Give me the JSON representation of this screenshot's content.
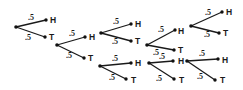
{
  "diagram": {
    "type": "probability-tree",
    "title": "",
    "edge_color": "#1a1a1a",
    "nodes": [
      {
        "id": "n0",
        "x": 16,
        "y": 27
      },
      {
        "id": "n1",
        "x": 57,
        "y": 45
      },
      {
        "id": "n2",
        "x": 101,
        "y": 33
      },
      {
        "id": "n3",
        "x": 100,
        "y": 66
      },
      {
        "id": "n4",
        "x": 147,
        "y": 45
      },
      {
        "id": "n5",
        "x": 149,
        "y": 63
      },
      {
        "id": "n6",
        "x": 191,
        "y": 26
      },
      {
        "id": "n7",
        "x": 187,
        "y": 61
      }
    ],
    "branches": [
      {
        "from": [
          16,
          27
        ],
        "to": [
          46,
          20
        ],
        "prob": ".5",
        "prob_pos": [
          28,
          20
        ],
        "outcome": "H",
        "outcome_pos": [
          50,
          23
        ]
      },
      {
        "from": [
          16,
          27
        ],
        "to": [
          45,
          37
        ],
        "prob": ".5",
        "prob_pos": [
          25,
          40
        ],
        "outcome": "T",
        "outcome_pos": [
          49,
          40
        ]
      },
      {
        "from": [
          57,
          45
        ],
        "to": [
          85,
          37
        ],
        "prob": ".5",
        "prob_pos": [
          69,
          36
        ],
        "outcome": "H",
        "outcome_pos": [
          89,
          40
        ]
      },
      {
        "from": [
          57,
          45
        ],
        "to": [
          84,
          58
        ],
        "prob": ".5",
        "prob_pos": [
          66,
          58
        ],
        "outcome": "T",
        "outcome_pos": [
          88,
          61
        ]
      },
      {
        "from": [
          101,
          33
        ],
        "to": [
          131,
          24
        ],
        "prob": ".5",
        "prob_pos": [
          113,
          24
        ],
        "outcome": "H",
        "outcome_pos": [
          135,
          27
        ]
      },
      {
        "from": [
          101,
          33
        ],
        "to": [
          131,
          41
        ],
        "prob": ".5",
        "prob_pos": [
          112,
          44
        ],
        "outcome": "T",
        "outcome_pos": [
          135,
          44
        ]
      },
      {
        "from": [
          100,
          66
        ],
        "to": [
          131,
          63
        ],
        "prob": ".5",
        "prob_pos": [
          112,
          61
        ],
        "outcome": "H",
        "outcome_pos": [
          135,
          66
        ]
      },
      {
        "from": [
          100,
          66
        ],
        "to": [
          126,
          79
        ],
        "prob": ".5",
        "prob_pos": [
          109,
          80
        ],
        "outcome": "T",
        "outcome_pos": [
          131,
          83
        ]
      },
      {
        "from": [
          147,
          45
        ],
        "to": [
          175,
          30
        ],
        "prob": ".5",
        "prob_pos": [
          158,
          32
        ],
        "outcome": "H",
        "outcome_pos": [
          178,
          34
        ]
      },
      {
        "from": [
          147,
          45
        ],
        "to": [
          174,
          50
        ],
        "prob": ".5",
        "prob_pos": [
          153,
          55
        ],
        "outcome": "T",
        "outcome_pos": [
          178,
          53
        ]
      },
      {
        "from": [
          149,
          63
        ],
        "to": [
          173,
          61
        ],
        "prob": ".5",
        "prob_pos": [
          159,
          59
        ],
        "outcome": "H",
        "outcome_pos": [
          178,
          64
        ]
      },
      {
        "from": [
          149,
          63
        ],
        "to": [
          174,
          79
        ],
        "prob": ".5",
        "prob_pos": [
          156,
          81
        ],
        "outcome": "T",
        "outcome_pos": [
          179,
          83
        ]
      },
      {
        "from": [
          191,
          26
        ],
        "to": [
          222,
          12
        ],
        "prob": ".5",
        "prob_pos": [
          205,
          15
        ],
        "outcome": "H",
        "outcome_pos": [
          226,
          15
        ]
      },
      {
        "from": [
          191,
          26
        ],
        "to": [
          219,
          33
        ],
        "prob": ".5",
        "prob_pos": [
          204,
          37
        ],
        "outcome": "T",
        "outcome_pos": [
          223,
          36
        ]
      },
      {
        "from": [
          187,
          61
        ],
        "to": [
          218,
          59
        ],
        "prob": ".5",
        "prob_pos": [
          199,
          56
        ],
        "outcome": "H",
        "outcome_pos": [
          222,
          63
        ]
      },
      {
        "from": [
          187,
          61
        ],
        "to": [
          215,
          80
        ],
        "prob": ".5",
        "prob_pos": [
          197,
          79
        ],
        "outcome": "T",
        "outcome_pos": [
          220,
          83
        ]
      }
    ]
  }
}
